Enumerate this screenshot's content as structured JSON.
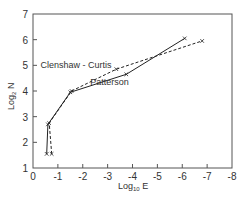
{
  "chart_data": {
    "type": "line",
    "title": "",
    "xlabel": "Log10 E",
    "xlabel_main": "Log",
    "xlabel_sub": "10",
    "xlabel_suffix": " E",
    "ylabel": "Log2 N",
    "ylabel_main": "Log",
    "ylabel_sub": "2",
    "ylabel_suffix": " N",
    "xlim": [
      0,
      -8
    ],
    "ylim": [
      1,
      7
    ],
    "x_ticks": [
      "0",
      "-1",
      "-2",
      "-3",
      "-4",
      "-5",
      "-6",
      "-7",
      "-8"
    ],
    "y_ticks": [
      "1",
      "2",
      "3",
      "4",
      "5",
      "6",
      "7"
    ],
    "grid": false,
    "legend": "none (inline annotations)",
    "series": [
      {
        "name": "Patterson",
        "style": "solid",
        "marker": "x",
        "points": [
          {
            "x": -0.55,
            "y": 1.55
          },
          {
            "x": -0.6,
            "y": 2.7
          },
          {
            "x": -1.5,
            "y": 3.95
          },
          {
            "x": -3.75,
            "y": 4.65
          },
          {
            "x": -6.1,
            "y": 6.05
          }
        ]
      },
      {
        "name": "Clenshaw - Curtis",
        "style": "dashed",
        "marker": "x",
        "points": [
          {
            "x": -0.75,
            "y": 1.55
          },
          {
            "x": -0.65,
            "y": 2.75
          },
          {
            "x": -1.55,
            "y": 4.0
          },
          {
            "x": -3.35,
            "y": 4.85
          },
          {
            "x": -6.8,
            "y": 5.95
          }
        ]
      }
    ],
    "annotations": [
      {
        "text": "Clenshaw - Curtis",
        "x": -0.3,
        "y": 5.0
      },
      {
        "text": "Patterson",
        "x": -2.3,
        "y": 4.35
      }
    ]
  }
}
